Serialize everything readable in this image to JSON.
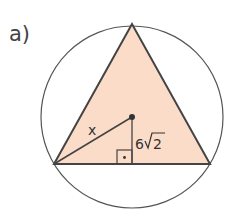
{
  "problem_label": "a)",
  "figure": {
    "labels": {
      "radius": "x",
      "apothem": "6√2",
      "apothem_num": "6",
      "apothem_rad": "2"
    },
    "colors": {
      "triangle_fill": "#fbdcc8",
      "stroke": "#444444"
    }
  }
}
